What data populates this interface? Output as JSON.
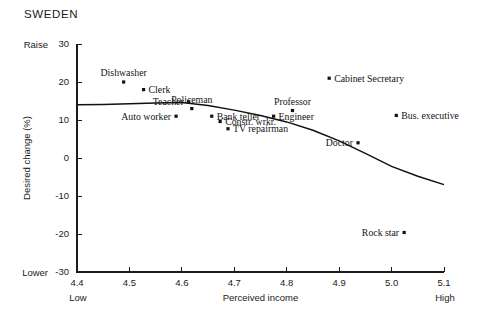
{
  "chart_data": {
    "type": "scatter",
    "title": "SWEDEN",
    "xlabel": "Perceived income",
    "ylabel": "Desired change (%)",
    "xlim": [
      4.4,
      5.1
    ],
    "ylim": [
      -30,
      30
    ],
    "xticks": [
      "4.4",
      "4.5",
      "4.6",
      "4.7",
      "4.8",
      "4.9",
      "5.0",
      "5.1"
    ],
    "xtick_values": [
      4.4,
      4.5,
      4.6,
      4.7,
      4.8,
      4.9,
      5.0,
      5.1
    ],
    "yticks": [
      "30",
      "20",
      "10",
      "0",
      "-10",
      "-20",
      "-30"
    ],
    "ytick_values": [
      30,
      20,
      10,
      0,
      -10,
      -20,
      -30
    ],
    "x_axis_low_label": "Low",
    "x_axis_high_label": "High",
    "y_axis_high_label": "Raise",
    "y_axis_low_label": "Lower",
    "grid": false,
    "legend": "none",
    "points": [
      {
        "label": "Dishwasher",
        "x": 4.489,
        "y": 20.0,
        "label_pos": "above"
      },
      {
        "label": "Clerk",
        "x": 4.527,
        "y": 18.0,
        "label_pos": "right"
      },
      {
        "label": "Teacher",
        "x": 4.613,
        "y": 14.8,
        "label_pos": "left"
      },
      {
        "label": "Policeman",
        "x": 4.619,
        "y": 13.0,
        "label_pos": "above"
      },
      {
        "label": "Auto worker",
        "x": 4.589,
        "y": 11.0,
        "label_pos": "left"
      },
      {
        "label": "Bank teller",
        "x": 4.657,
        "y": 11.0,
        "label_pos": "right"
      },
      {
        "label": "Constr. wrkr.",
        "x": 4.673,
        "y": 9.6,
        "label_pos": "right"
      },
      {
        "label": "TV repairman",
        "x": 4.688,
        "y": 7.7,
        "label_pos": "right"
      },
      {
        "label": "Engineer",
        "x": 4.775,
        "y": 11.0,
        "label_pos": "right"
      },
      {
        "label": "Professor",
        "x": 4.811,
        "y": 12.5,
        "label_pos": "above"
      },
      {
        "label": "Cabinet Secretary",
        "x": 4.881,
        "y": 21.0,
        "label_pos": "right"
      },
      {
        "label": "Bus. executive",
        "x": 5.009,
        "y": 11.2,
        "label_pos": "right"
      },
      {
        "label": "Doctor",
        "x": 4.936,
        "y": 4.0,
        "label_pos": "left"
      },
      {
        "label": "Rock star",
        "x": 5.024,
        "y": -19.6,
        "label_pos": "left"
      }
    ],
    "trend_curve": {
      "name": "fitted-trend",
      "x": [
        4.4,
        4.45,
        4.5,
        4.55,
        4.6,
        4.65,
        4.7,
        4.75,
        4.8,
        4.85,
        4.9,
        4.95,
        5.0,
        5.05,
        5.1
      ],
      "y": [
        14.0,
        14.1,
        14.3,
        14.5,
        14.6,
        13.8,
        12.6,
        11.2,
        9.5,
        7.3,
        4.5,
        1.2,
        -2.2,
        -4.8,
        -7.0
      ]
    }
  }
}
